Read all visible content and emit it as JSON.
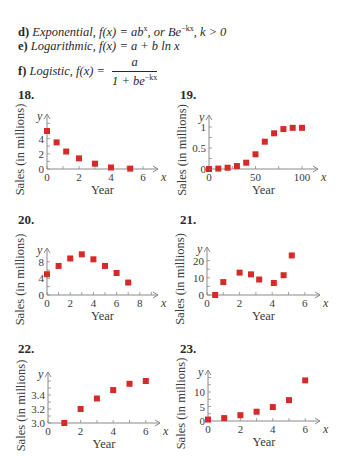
{
  "text": {
    "d": {
      "label": "d)",
      "name": "Exponential,",
      "formula_pre": "f(x) = ab",
      "formula_sup1": "x",
      "formula_mid": ", or Be",
      "formula_sup2": "−kx",
      "formula_post": ", k > 0"
    },
    "e": {
      "label": "e)",
      "name": "Logarithmic,",
      "formula": "f(x) = a + b ln x"
    },
    "f": {
      "label": "f)",
      "name": "Logistic,",
      "formula_pre": "f(x) =",
      "numerator": "a",
      "denominator_pre": "1 + be",
      "denominator_sup": "−kx"
    }
  },
  "colors": {
    "marker": "#d42a2a",
    "axis": "#8a8a8a",
    "text": "#2a2a2a"
  },
  "chart_data": [
    {
      "id": "18",
      "type": "scatter",
      "title": "18.",
      "xlabel": "Year",
      "ylabel": "Sales (in millions)",
      "x_var": "x",
      "y_var": "y",
      "xticks": [
        0,
        2,
        4,
        6
      ],
      "yticks": [
        0,
        2,
        4
      ],
      "xlim": [
        0,
        6.8
      ],
      "ylim": [
        0,
        5.5
      ],
      "points": [
        [
          0,
          5
        ],
        [
          0.6,
          3.5
        ],
        [
          1.2,
          2.3
        ],
        [
          2,
          1.4
        ],
        [
          3,
          0.7
        ],
        [
          4,
          0.2
        ],
        [
          5.2,
          0.05
        ]
      ],
      "px": {
        "x0": 47,
        "y0": 169,
        "xs": 16,
        "ys": 7.6,
        "xmax": 158,
        "ymax": 114
      }
    },
    {
      "id": "19",
      "type": "scatter",
      "title": "19.",
      "xlabel": "Year",
      "ylabel": "Sales (in millions)",
      "x_var": "x",
      "y_var": "y",
      "xticks": [
        0,
        50,
        100
      ],
      "yticks": [
        0,
        0.5,
        1
      ],
      "xlim": [
        0,
        110
      ],
      "ylim": [
        0,
        1.2
      ],
      "points": [
        [
          0,
          0
        ],
        [
          10,
          0.01
        ],
        [
          20,
          0.03
        ],
        [
          30,
          0.07
        ],
        [
          40,
          0.15
        ],
        [
          50,
          0.35
        ],
        [
          60,
          0.65
        ],
        [
          70,
          0.85
        ],
        [
          80,
          0.95
        ],
        [
          90,
          0.98
        ],
        [
          100,
          0.98
        ]
      ],
      "px": {
        "x0": 209,
        "y0": 169,
        "xs": 0.93,
        "ys": 42,
        "xmax": 318,
        "ymax": 115
      }
    },
    {
      "id": "20",
      "type": "scatter",
      "title": "20.",
      "xlabel": "Year",
      "ylabel": "Sales (in millions)",
      "x_var": "x",
      "y_var": "y",
      "xticks": [
        0,
        2,
        4,
        6,
        8
      ],
      "yticks": [
        0,
        4,
        8
      ],
      "xlim": [
        0,
        9
      ],
      "ylim": [
        0,
        11
      ],
      "points": [
        [
          0,
          5
        ],
        [
          1,
          7
        ],
        [
          2,
          8.8
        ],
        [
          3,
          9.8
        ],
        [
          4,
          8.6
        ],
        [
          5,
          7
        ],
        [
          6,
          5.3
        ],
        [
          7,
          3
        ]
      ],
      "px": {
        "x0": 47,
        "y0": 295,
        "xs": 11.6,
        "ys": 4.15,
        "xmax": 158,
        "ymax": 248
      }
    },
    {
      "id": "21",
      "type": "scatter",
      "title": "21.",
      "xlabel": "Year",
      "ylabel": "Sales (in millions)",
      "x_var": "x",
      "y_var": "y",
      "xticks": [
        0,
        2,
        4,
        6
      ],
      "yticks": [
        0,
        10,
        20
      ],
      "xlim": [
        0,
        6.8
      ],
      "ylim": [
        0,
        28
      ],
      "points": [
        [
          0.5,
          0
        ],
        [
          1,
          7.5
        ],
        [
          2,
          13
        ],
        [
          2.7,
          12
        ],
        [
          3.2,
          9
        ],
        [
          4.1,
          7
        ],
        [
          4.7,
          11.5
        ],
        [
          5.2,
          23
        ]
      ],
      "px": {
        "x0": 207,
        "y0": 295,
        "xs": 16.3,
        "ys": 1.72,
        "xmax": 320,
        "ymax": 247
      }
    },
    {
      "id": "22",
      "type": "scatter",
      "title": "22.",
      "xlabel": "Year",
      "ylabel": "Sales (in millions)",
      "x_var": "x",
      "y_var": "y",
      "xticks": [
        0,
        2,
        4,
        6
      ],
      "yticks": [
        3.0,
        3.2,
        3.4
      ],
      "xlim": [
        0,
        6.8
      ],
      "ylim": [
        3.0,
        3.7
      ],
      "points": [
        [
          1,
          3.0
        ],
        [
          2,
          3.2
        ],
        [
          3,
          3.35
        ],
        [
          4,
          3.47
        ],
        [
          5,
          3.56
        ],
        [
          6,
          3.6
        ]
      ],
      "px": {
        "x0": 48,
        "y0": 423,
        "xs": 16.3,
        "ys": 70,
        "xmax": 160,
        "ymax": 372,
        "ybase": 3.0
      }
    },
    {
      "id": "23",
      "type": "scatter",
      "title": "23.",
      "xlabel": "Year",
      "ylabel": "Sales (in millions)",
      "x_var": "x",
      "y_var": "y",
      "xticks": [
        0,
        2,
        4,
        6
      ],
      "yticks": [
        0,
        5,
        10
      ],
      "xlim": [
        0,
        6.8
      ],
      "ylim": [
        0,
        16
      ],
      "points": [
        [
          0,
          0.5
        ],
        [
          1,
          1
        ],
        [
          2,
          2
        ],
        [
          3,
          3.2
        ],
        [
          4,
          4.8
        ],
        [
          5,
          7.2
        ],
        [
          6,
          14
        ]
      ],
      "px": {
        "x0": 208,
        "y0": 421,
        "xs": 16.2,
        "ys": 2.9,
        "xmax": 320,
        "ymax": 370
      }
    }
  ]
}
